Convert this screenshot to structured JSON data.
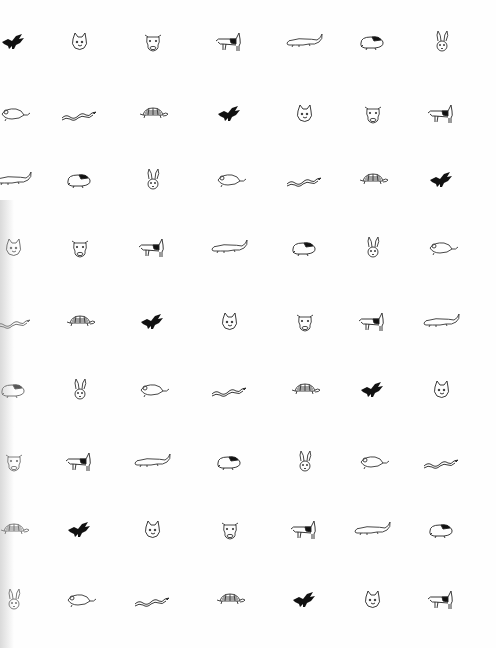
{
  "page": {
    "background": "#fefefe",
    "ink_color": "#111111",
    "rows": 9,
    "columns": 7
  },
  "animal_sequence": [
    "bird",
    "cat",
    "cow",
    "dog",
    "alligator",
    "guinea-pig",
    "rabbit",
    "mouse",
    "snake",
    "turtle"
  ],
  "column_x": [
    14,
    80,
    153,
    230,
    305,
    373,
    442
  ],
  "row_y": [
    42,
    114,
    180,
    248,
    322,
    390,
    462,
    530,
    600
  ],
  "grid": [
    [
      "bird",
      "cat",
      "cow",
      "dog",
      "alligator",
      "guinea-pig",
      "rabbit"
    ],
    [
      "mouse",
      "snake",
      "turtle",
      "bird",
      "cat",
      "cow",
      "dog"
    ],
    [
      "alligator",
      "guinea-pig",
      "rabbit",
      "mouse",
      "snake",
      "turtle",
      "bird"
    ],
    [
      "cat",
      "cow",
      "dog",
      "alligator",
      "guinea-pig",
      "rabbit",
      "mouse"
    ],
    [
      "snake",
      "turtle",
      "bird",
      "cat",
      "cow",
      "dog",
      "alligator"
    ],
    [
      "guinea-pig",
      "rabbit",
      "mouse",
      "snake",
      "turtle",
      "bird",
      "cat"
    ],
    [
      "cow",
      "dog",
      "alligator",
      "guinea-pig",
      "rabbit",
      "mouse",
      "snake"
    ],
    [
      "turtle",
      "bird",
      "cat",
      "cow",
      "dog",
      "alligator",
      "guinea-pig"
    ],
    [
      "rabbit",
      "mouse",
      "snake",
      "turtle",
      "bird",
      "cat",
      "dog"
    ]
  ]
}
